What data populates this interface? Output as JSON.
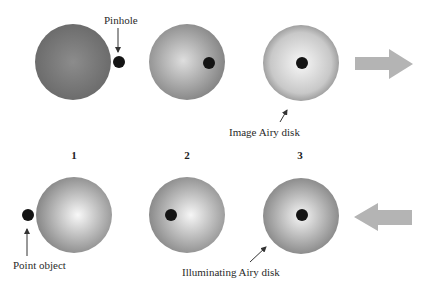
{
  "diagram": {
    "labels": {
      "pinhole": "Pinhole",
      "image_airy_disk": "Image Airy disk",
      "point_object": "Point object",
      "illuminating_airy_disk": "Illuminating Airy disk"
    },
    "stage_numbers": [
      "1",
      "2",
      "3"
    ],
    "top_row": {
      "description": "Image Airy disk moving onto pinhole",
      "disks": [
        {
          "cx": 73,
          "cy": 62,
          "r": 38,
          "center_color": "#8a8a8a",
          "edge_color": "#6e6e6e",
          "dot_cx": 119,
          "dot_cy": 62
        },
        {
          "cx": 187,
          "cy": 62,
          "r": 38,
          "center_color": "#d8d8d8",
          "edge_color": "#8a8a8a",
          "dot_cx": 209,
          "dot_cy": 63
        },
        {
          "cx": 301,
          "cy": 63,
          "r": 38,
          "center_color": "#f4f4f4",
          "edge_color": "#a5a5a5",
          "dot_cx": 302,
          "dot_cy": 63
        }
      ],
      "arrow_direction": "right"
    },
    "bottom_row": {
      "description": "Illuminating Airy disk moving onto point object",
      "disks": [
        {
          "cx": 74,
          "cy": 215,
          "r": 38,
          "center_color": "#f6f6f6",
          "edge_color": "#8c8c8c",
          "dot_cx": 28,
          "dot_cy": 215
        },
        {
          "cx": 187,
          "cy": 215,
          "r": 38,
          "center_color": "#f6f6f6",
          "edge_color": "#8c8c8c",
          "dot_cx": 171,
          "dot_cy": 215
        },
        {
          "cx": 301,
          "cy": 216,
          "r": 38,
          "center_color": "#f6f6f6",
          "edge_color": "#8c8c8c",
          "dot_cx": 302,
          "dot_cy": 215
        }
      ],
      "arrow_direction": "left"
    },
    "colors": {
      "dot": "#141414",
      "big_arrow": "#b4b4b4",
      "pointer_arrow": "#333333"
    }
  }
}
